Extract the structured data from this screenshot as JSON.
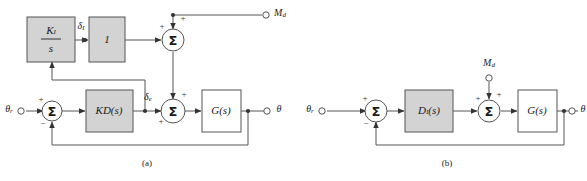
{
  "figure": {
    "type": "control-system-block-diagram",
    "panels": [
      {
        "id": "a",
        "caption": "(a)",
        "blocks": [
          {
            "name": "integral-gain-block",
            "numerator": "K",
            "numerator_sub": "I",
            "denominator": "s",
            "shaded": true
          },
          {
            "name": "unity-block",
            "label": "1",
            "shaded": true
          },
          {
            "name": "kd-block",
            "label": "KD(s)",
            "shaded": true
          },
          {
            "name": "plant-block",
            "label": "G(s)",
            "shaded": false
          }
        ],
        "summers": [
          {
            "name": "upper-summer",
            "symbol": "Σ",
            "signs": [
              "+",
              "+"
            ]
          },
          {
            "name": "input-summer",
            "symbol": "Σ",
            "signs": [
              "+",
              "−"
            ]
          },
          {
            "name": "lower-summer",
            "symbol": "Σ",
            "signs": [
              "+",
              "+",
              "+"
            ]
          }
        ],
        "signals": [
          {
            "name": "integral-signal-label",
            "base": "δ",
            "sub": "I"
          },
          {
            "name": "error-signal-label",
            "base": "δ",
            "sub": "e"
          }
        ],
        "ports": [
          {
            "name": "reference-input-port",
            "base": "θ",
            "sub": "r"
          },
          {
            "name": "disturbance-input-port",
            "base": "M",
            "sub": "d"
          },
          {
            "name": "output-port",
            "base": "θ",
            "sub": ""
          }
        ]
      },
      {
        "id": "b",
        "caption": "(b)",
        "blocks": [
          {
            "name": "compensator-block",
            "base": "D",
            "sub": "I",
            "suffix": "(s)",
            "shaded": true
          },
          {
            "name": "plant-block",
            "label": "G(s)",
            "shaded": false
          }
        ],
        "summers": [
          {
            "name": "input-summer",
            "symbol": "Σ",
            "signs": [
              "+",
              "−"
            ]
          },
          {
            "name": "disturbance-summer",
            "symbol": "Σ",
            "signs": [
              "+",
              "+"
            ]
          }
        ],
        "ports": [
          {
            "name": "reference-input-port",
            "base": "θ",
            "sub": "r"
          },
          {
            "name": "disturbance-input-port",
            "base": "M",
            "sub": "d"
          },
          {
            "name": "output-port",
            "base": "θ",
            "sub": ""
          }
        ]
      }
    ]
  },
  "panel_a": {
    "caption": "(a)",
    "ki_numerator": "K",
    "ki_numerator_sub": "I",
    "ki_denominator": "s",
    "unity_label": "1",
    "kd_label": "KD(s)",
    "plant_label": "G(s)",
    "sigma": "Σ",
    "delta_i_base": "δ",
    "delta_i_sub": "I",
    "delta_e_base": "δ",
    "delta_e_sub": "e",
    "theta_r_base": "θ",
    "theta_r_sub": "r",
    "md_base": "M",
    "md_sub": "d",
    "theta_out": "θ",
    "plus": "+",
    "minus": "−"
  },
  "panel_b": {
    "caption": "(b)",
    "di_base": "D",
    "di_sub": "I",
    "di_suffix": "(s)",
    "plant_label": "G(s)",
    "sigma": "Σ",
    "theta_r_base": "θ",
    "theta_r_sub": "r",
    "md_base": "M",
    "md_sub": "d",
    "theta_out": "θ",
    "plus": "+",
    "minus": "−"
  },
  "colors": {
    "shaded_block_fill": "#d3d3d3",
    "block_stroke": "#555555",
    "wire": "#555555",
    "text": "#1a1a1a",
    "background": "#ffffff"
  }
}
